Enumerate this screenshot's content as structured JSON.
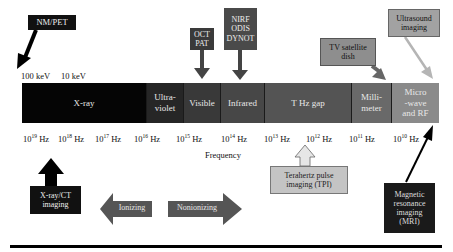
{
  "spectrum": {
    "segments": [
      {
        "label": "X-ray",
        "color": "#050505"
      },
      {
        "label": "Ultra-\nviolet",
        "color": "#262626"
      },
      {
        "label": "Visible",
        "color": "#393939"
      },
      {
        "label": "Infrared",
        "color": "#474747"
      },
      {
        "label": "T Hz gap",
        "color": "#545454"
      },
      {
        "label": "Milli-\nmeter",
        "color": "#696969"
      },
      {
        "label": "Micro\n-wave\nand RF",
        "color": "#8a8a8a"
      }
    ]
  },
  "energy_labels": [
    "100 keV",
    "10 keV"
  ],
  "frequency": {
    "axis_label": "Frequency",
    "ticks": [
      {
        "base": "10",
        "exp": "19",
        "unit": "Hz"
      },
      {
        "base": "10",
        "exp": "18",
        "unit": "Hz"
      },
      {
        "base": "10",
        "exp": "17",
        "unit": "Hz"
      },
      {
        "base": "10",
        "exp": "16",
        "unit": "Hz"
      },
      {
        "base": "10",
        "exp": "15",
        "unit": "Hz"
      },
      {
        "base": "10",
        "exp": "14",
        "unit": "Hz"
      },
      {
        "base": "10",
        "exp": "13",
        "unit": "Hz"
      },
      {
        "base": "10",
        "exp": "12",
        "unit": "Hz"
      },
      {
        "base": "10",
        "exp": "11",
        "unit": "Hz"
      },
      {
        "base": "10",
        "exp": "10",
        "unit": "Hz"
      }
    ]
  },
  "callouts": {
    "nm_pet": "NM/PET",
    "oct_pat": "OCT\nPAT",
    "nirf": "NIRF\nODIS\nDYNOT",
    "tv_satellite": "TV satellite\ndish",
    "ultrasound": "Ultrasound\nimaging",
    "xray_ct": "X-ray/CT\nimaging",
    "tpi": "Terahertz pulse\nimaging (TPI)",
    "mri": "Magnetic\nresonance\nimaging\n(MRI)"
  },
  "regions": {
    "ionizing": "Ionizing",
    "nonionizing": "Nonionizing"
  },
  "colors": {
    "dark_box": "#111111",
    "mid_box": "#4d4d4d",
    "light_box": "#9a9a9a",
    "tpi_box": "#c4c4c4",
    "arrow_gray": "#5a5a5a"
  }
}
